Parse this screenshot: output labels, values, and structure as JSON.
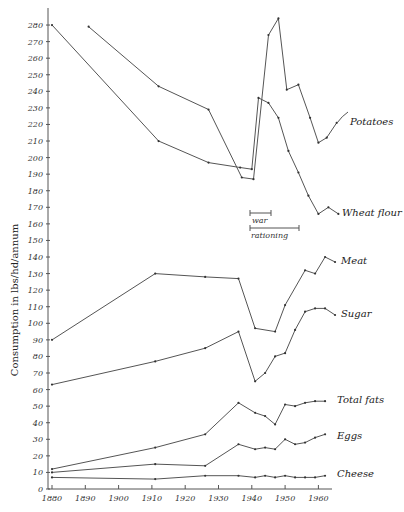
{
  "chart_data": {
    "type": "line",
    "title": "",
    "xlabel": "",
    "ylabel": "Consumption in lbs/hd/annum",
    "xlim": [
      1880,
      1966
    ],
    "ylim": [
      0,
      280
    ],
    "x_ticks": [
      1880,
      1890,
      1900,
      1910,
      1920,
      1930,
      1940,
      1950,
      1960
    ],
    "y_ticks": [
      0,
      10,
      20,
      30,
      40,
      50,
      60,
      70,
      80,
      90,
      100,
      110,
      120,
      130,
      140,
      150,
      160,
      170,
      180,
      190,
      200,
      210,
      220,
      230,
      240,
      250,
      260,
      270,
      280
    ],
    "grid": false,
    "legend": "inline labels at right end of each series",
    "annotations": [
      {
        "text": "war",
        "x_start": 1939,
        "x_end": 1945.5
      },
      {
        "text": "rationing",
        "x_start": 1939,
        "x_end": 1954
      }
    ],
    "series": [
      {
        "name": "Potatoes",
        "x": [
          1891,
          1912,
          1927,
          1937,
          1940.5,
          1945,
          1948,
          1950.5,
          1954,
          1957.5,
          1960,
          1962.5,
          1965.5
        ],
        "values": [
          279,
          243,
          229,
          188,
          187,
          274,
          284,
          241,
          244,
          224,
          209,
          212,
          221
        ]
      },
      {
        "name": "Wheat flour",
        "x": [
          1880,
          1912,
          1927,
          1936.5,
          1940,
          1942,
          1945,
          1948,
          1951,
          1954,
          1957,
          1960,
          1963,
          1966
        ],
        "values": [
          280,
          210,
          197,
          194,
          193,
          236,
          233,
          224,
          204,
          191,
          177,
          166,
          170,
          166
        ]
      },
      {
        "name": "Meat",
        "x": [
          1880,
          1911,
          1926,
          1936,
          1941,
          1947,
          1950,
          1956,
          1959,
          1962,
          1965
        ],
        "values": [
          90,
          130,
          128,
          127,
          97,
          95,
          111,
          132,
          130,
          140,
          137
        ]
      },
      {
        "name": "Sugar",
        "x": [
          1880,
          1911,
          1926,
          1936,
          1941,
          1944,
          1947,
          1950,
          1953,
          1956,
          1959,
          1962,
          1965
        ],
        "values": [
          63,
          77,
          85,
          95,
          65,
          70,
          80,
          82,
          96,
          107,
          109,
          109,
          105
        ]
      },
      {
        "name": "Total fats",
        "x": [
          1880,
          1911,
          1926,
          1936,
          1941,
          1944,
          1947,
          1950,
          1953,
          1956,
          1959,
          1962
        ],
        "values": [
          12,
          25,
          33,
          52,
          46,
          44,
          39,
          51,
          50,
          52,
          53,
          53
        ]
      },
      {
        "name": "Eggs",
        "x": [
          1880,
          1911,
          1926,
          1936,
          1941,
          1944,
          1947,
          1950,
          1953,
          1956,
          1959,
          1962
        ],
        "values": [
          10,
          15,
          14,
          27,
          24,
          25,
          24,
          30,
          27,
          28,
          31,
          33
        ]
      },
      {
        "name": "Cheese",
        "x": [
          1880,
          1911,
          1926,
          1936,
          1941,
          1944,
          1947,
          1950,
          1953,
          1956,
          1959,
          1962
        ],
        "values": [
          7,
          6,
          8,
          8,
          7,
          8,
          7,
          8,
          7,
          7,
          7,
          8
        ]
      }
    ]
  },
  "labels": {
    "potatoes": "Potatoes",
    "wheat": "Wheat flour",
    "meat": "Meat",
    "sugar": "Sugar",
    "fats": "Total fats",
    "eggs": "Eggs",
    "cheese": "Cheese",
    "war": "war",
    "rationing": "rationing",
    "ylabel": "Consumption in lbs/hd/annum"
  }
}
